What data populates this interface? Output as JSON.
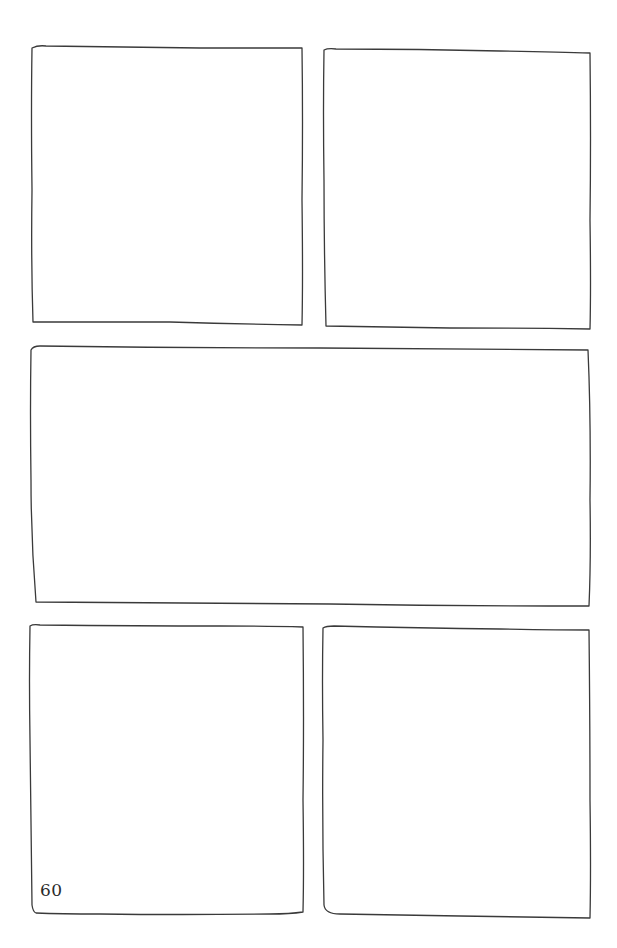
{
  "page": {
    "number": "60",
    "background": "#ffffff",
    "ink_color": "#3a3a3a"
  },
  "panels": [
    {
      "id": "panel-1",
      "row": 1,
      "position": "top-left",
      "x": 31,
      "y": 47,
      "w": 272,
      "h": 279
    },
    {
      "id": "panel-2",
      "row": 1,
      "position": "top-right",
      "x": 323,
      "y": 49,
      "w": 268,
      "h": 280
    },
    {
      "id": "panel-3",
      "row": 2,
      "position": "middle-wide",
      "x": 30,
      "y": 346,
      "w": 561,
      "h": 260
    },
    {
      "id": "panel-4",
      "row": 3,
      "position": "bottom-left",
      "x": 29,
      "y": 624,
      "w": 275,
      "h": 290
    },
    {
      "id": "panel-5",
      "row": 3,
      "position": "bottom-right",
      "x": 322,
      "y": 626,
      "w": 269,
      "h": 292
    }
  ]
}
